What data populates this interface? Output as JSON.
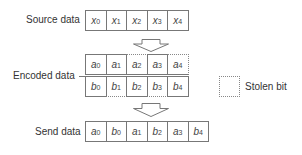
{
  "diagram": {
    "source": {
      "label": "Source data",
      "cells": [
        {
          "var": "x",
          "sub": "0"
        },
        {
          "var": "x",
          "sub": "1"
        },
        {
          "var": "x",
          "sub": "2"
        },
        {
          "var": "x",
          "sub": "3"
        },
        {
          "var": "x",
          "sub": "4"
        }
      ]
    },
    "encoded": {
      "label": "Encoded data",
      "row_a": [
        {
          "var": "a",
          "sub": "0",
          "stolen": false
        },
        {
          "var": "a",
          "sub": "1",
          "stolen": false
        },
        {
          "var": "a",
          "sub": "2",
          "stolen": true
        },
        {
          "var": "a",
          "sub": "3",
          "stolen": false
        },
        {
          "var": "a",
          "sub": "4",
          "stolen": true
        }
      ],
      "row_b": [
        {
          "var": "b",
          "sub": "0",
          "stolen": false
        },
        {
          "var": "b",
          "sub": "1",
          "stolen": true
        },
        {
          "var": "b",
          "sub": "2",
          "stolen": false
        },
        {
          "var": "b",
          "sub": "3",
          "stolen": true
        },
        {
          "var": "b",
          "sub": "4",
          "stolen": false
        }
      ]
    },
    "send": {
      "label": "Send data",
      "cells": [
        {
          "var": "a",
          "sub": "0"
        },
        {
          "var": "b",
          "sub": "0"
        },
        {
          "var": "a",
          "sub": "1"
        },
        {
          "var": "b",
          "sub": "2"
        },
        {
          "var": "a",
          "sub": "3"
        },
        {
          "var": "b",
          "sub": "4"
        }
      ]
    },
    "legend": {
      "label": "Stolen bit",
      "style": "dotted-box"
    },
    "colors": {
      "line": "#777777",
      "text": "#333333"
    }
  }
}
